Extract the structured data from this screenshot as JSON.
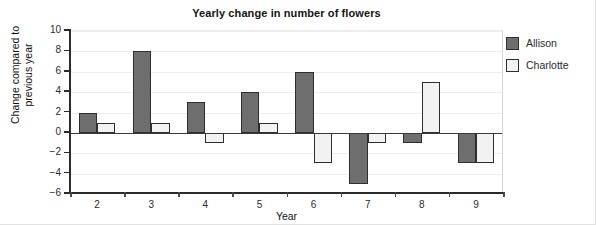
{
  "chart_data": {
    "type": "bar",
    "title": "Yearly change in number of flowers",
    "xlabel": "Year",
    "ylabel": "Change compared to previous year",
    "ylabel_lines": [
      "Change compared to",
      "previous year"
    ],
    "categories": [
      "2",
      "3",
      "4",
      "5",
      "6",
      "7",
      "8",
      "9"
    ],
    "series": [
      {
        "name": "Allison",
        "color": "#6e6e6e",
        "edge_color": "#2e2e2e",
        "values": [
          2,
          8,
          3,
          4,
          6,
          -5,
          -1,
          -3
        ]
      },
      {
        "name": "Charlotte",
        "color": "#f2f2f2",
        "edge_color": "#2e2e2e",
        "values": [
          1,
          1,
          -1,
          1,
          -3,
          -1,
          5,
          -3
        ]
      }
    ],
    "ylim": [
      -6,
      10
    ],
    "ytick_values": [
      10,
      8,
      6,
      4,
      2,
      0,
      -2,
      -4,
      -6
    ],
    "ytick_labels": [
      "10",
      "8",
      "6",
      "4",
      "2",
      "0",
      "−2",
      "−4",
      "−6"
    ],
    "grid": true,
    "grid_axis": "y",
    "legend_position": "right",
    "background": "#ffffff",
    "gridline_color": "#ededed",
    "zeroline_color": "#3a3a3a"
  },
  "legend": {
    "entries": [
      {
        "label": "Allison"
      },
      {
        "label": "Charlotte"
      }
    ]
  }
}
